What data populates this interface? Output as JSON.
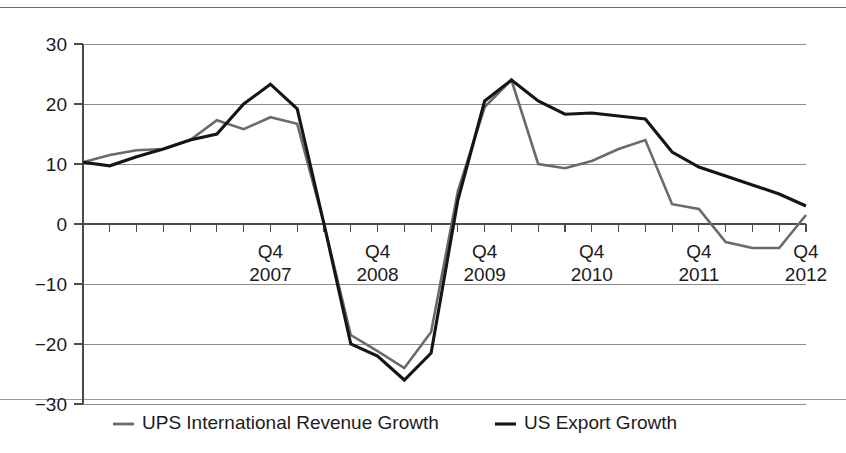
{
  "chart_data": {
    "type": "line",
    "title": "",
    "subtitle": "",
    "xlabel": "",
    "ylabel": "",
    "ylim": [
      -30,
      30
    ],
    "yticks": [
      30,
      20,
      10,
      0,
      -10,
      -20,
      -30
    ],
    "ytick_labels": [
      "30",
      "20",
      "10",
      "0",
      "−10",
      "−20",
      "−30"
    ],
    "grid": true,
    "legend_position": "bottom",
    "x_tick_count": 28,
    "x_major_labels": [
      {
        "quarter": "Q4",
        "year": "2007",
        "index": 7
      },
      {
        "quarter": "Q4",
        "year": "2008",
        "index": 11
      },
      {
        "quarter": "Q4",
        "year": "2009",
        "index": 15
      },
      {
        "quarter": "Q4",
        "year": "2010",
        "index": 19
      },
      {
        "quarter": "Q4",
        "year": "2011",
        "index": 23
      },
      {
        "quarter": "Q4",
        "year": "2012",
        "index": 27
      }
    ],
    "x": [
      "Q1 2006",
      "Q2 2006",
      "Q3 2006",
      "Q4 2006",
      "Q1 2007",
      "Q2 2007",
      "Q3 2007",
      "Q4 2007",
      "Q1 2008",
      "Q2 2008",
      "Q3 2008",
      "Q4 2008",
      "Q1 2009",
      "Q2 2009",
      "Q3 2009",
      "Q4 2009",
      "Q1 2010",
      "Q2 2010",
      "Q3 2010",
      "Q4 2010",
      "Q1 2011",
      "Q2 2011",
      "Q3 2011",
      "Q4 2011",
      "Q1 2012",
      "Q2 2012",
      "Q3 2012",
      "Q4 2012"
    ],
    "series": [
      {
        "name": "UPS International Revenue Growth",
        "color": "#6a6a6a",
        "values": [
          10.3,
          11.5,
          12.3,
          12.5,
          14.0,
          17.3,
          15.8,
          17.8,
          16.7,
          0.0,
          -18.5,
          -21.2,
          -24.0,
          -18.0,
          5.5,
          19.5,
          24.0,
          10.0,
          9.3,
          10.5,
          12.5,
          14.0,
          3.3,
          2.5,
          -3.0,
          -4.0,
          -4.0,
          1.5
        ]
      },
      {
        "name": "US Export Growth",
        "color": "#151515",
        "values": [
          10.3,
          9.7,
          11.2,
          12.5,
          14.0,
          15.0,
          20.0,
          23.3,
          19.2,
          0.0,
          -20.0,
          -22.0,
          -26.0,
          -21.5,
          4.0,
          20.5,
          24.0,
          20.5,
          18.3,
          18.5,
          18.0,
          17.5,
          12.0,
          9.5,
          8.0,
          6.5,
          5.0,
          3.0
        ]
      }
    ]
  },
  "legend": {
    "items": [
      {
        "label": "UPS International Revenue Growth",
        "color": "#6a6a6a"
      },
      {
        "label": "US Export Growth",
        "color": "#151515"
      }
    ]
  }
}
